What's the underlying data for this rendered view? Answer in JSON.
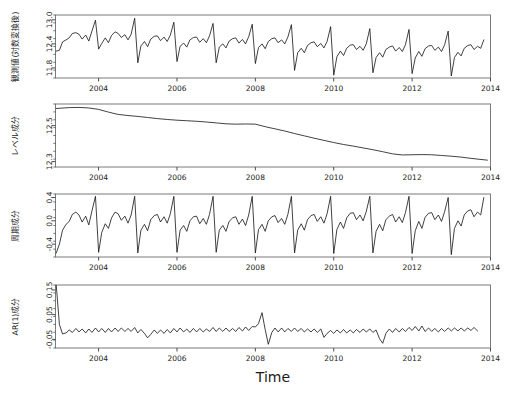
{
  "figure": {
    "x_axis_title": "Time",
    "x_tick_labels": [
      "2004",
      "2006",
      "2008",
      "2010",
      "2012",
      "2014"
    ],
    "x_tick_values": [
      2004,
      2006,
      2008,
      2010,
      2012,
      2014
    ],
    "x_range": [
      2002.9,
      2014.0
    ]
  },
  "chart_data": [
    {
      "type": "line",
      "title": "",
      "panel_index": 1,
      "ylabel": "観測値(対数変換後)",
      "xlabel": "",
      "ylim": [
        11.55,
        13.12
      ],
      "y_ticks": [
        11.8,
        12.4,
        13.0
      ],
      "y_tick_labels": [
        "11.8",
        "12.4",
        "13.0"
      ],
      "xlim": [
        2002.9,
        2014.0
      ],
      "grid": false,
      "legend": "none",
      "x": [
        2002.92,
        2003.0,
        2003.08,
        2003.17,
        2003.25,
        2003.33,
        2003.42,
        2003.5,
        2003.58,
        2003.67,
        2003.75,
        2003.83,
        2003.92,
        2004.0,
        2004.08,
        2004.17,
        2004.25,
        2004.33,
        2004.42,
        2004.5,
        2004.58,
        2004.67,
        2004.75,
        2004.83,
        2004.92,
        2005.0,
        2005.08,
        2005.17,
        2005.25,
        2005.33,
        2005.42,
        2005.5,
        2005.58,
        2005.67,
        2005.75,
        2005.83,
        2005.92,
        2006.0,
        2006.08,
        2006.17,
        2006.25,
        2006.33,
        2006.42,
        2006.5,
        2006.58,
        2006.67,
        2006.75,
        2006.83,
        2006.92,
        2007.0,
        2007.08,
        2007.17,
        2007.25,
        2007.33,
        2007.42,
        2007.5,
        2007.58,
        2007.67,
        2007.75,
        2007.83,
        2007.92,
        2008.0,
        2008.08,
        2008.17,
        2008.25,
        2008.33,
        2008.42,
        2008.5,
        2008.58,
        2008.67,
        2008.75,
        2008.83,
        2008.92,
        2009.0,
        2009.08,
        2009.17,
        2009.25,
        2009.33,
        2009.42,
        2009.5,
        2009.58,
        2009.67,
        2009.75,
        2009.83,
        2009.92,
        2010.0,
        2010.08,
        2010.17,
        2010.25,
        2010.33,
        2010.42,
        2010.5,
        2010.58,
        2010.67,
        2010.75,
        2010.83,
        2010.92,
        2011.0,
        2011.08,
        2011.17,
        2011.25,
        2011.33,
        2011.42,
        2011.5,
        2011.58,
        2011.67,
        2011.75,
        2011.83,
        2011.92,
        2012.0,
        2012.08,
        2012.17,
        2012.25,
        2012.33,
        2012.42,
        2012.5,
        2012.58,
        2012.67,
        2012.75,
        2012.83,
        2012.92,
        2013.0,
        2013.08,
        2013.17,
        2013.25,
        2013.33,
        2013.42,
        2013.5,
        2013.58,
        2013.67,
        2013.75,
        2013.83,
        2013.92
      ],
      "values": [
        12.22,
        12.24,
        12.45,
        12.5,
        12.55,
        12.66,
        12.68,
        12.64,
        12.52,
        12.62,
        12.47,
        12.72,
        12.99,
        12.27,
        12.41,
        12.55,
        12.43,
        12.61,
        12.7,
        12.66,
        12.56,
        12.63,
        12.5,
        12.64,
        13.04,
        11.93,
        12.35,
        12.46,
        12.33,
        12.52,
        12.59,
        12.6,
        12.48,
        12.57,
        12.46,
        12.62,
        12.94,
        11.96,
        12.34,
        12.42,
        12.32,
        12.5,
        12.56,
        12.57,
        12.44,
        12.53,
        12.43,
        12.6,
        12.91,
        11.93,
        12.32,
        12.4,
        12.3,
        12.47,
        12.53,
        12.55,
        12.42,
        12.51,
        12.4,
        12.58,
        12.89,
        11.91,
        12.31,
        12.4,
        12.28,
        12.46,
        12.53,
        12.55,
        12.43,
        12.5,
        12.4,
        12.57,
        12.88,
        11.74,
        12.18,
        12.29,
        12.18,
        12.36,
        12.43,
        12.45,
        12.33,
        12.41,
        12.3,
        12.46,
        12.83,
        11.62,
        12.08,
        12.22,
        12.11,
        12.29,
        12.37,
        12.38,
        12.26,
        12.34,
        12.24,
        12.4,
        12.78,
        11.68,
        12.06,
        12.18,
        12.07,
        12.26,
        12.32,
        12.35,
        12.22,
        12.31,
        12.21,
        12.38,
        12.76,
        11.66,
        12.05,
        12.21,
        12.09,
        12.28,
        12.35,
        12.36,
        12.24,
        12.32,
        12.21,
        12.38,
        12.72,
        11.6,
        12.06,
        12.19,
        12.1,
        12.29,
        12.36,
        12.38,
        12.26,
        12.34,
        12.29,
        12.5
      ]
    },
    {
      "type": "line",
      "title": "",
      "panel_index": 2,
      "ylabel": "レベル成分",
      "xlabel": "",
      "ylim": [
        12.27,
        12.62
      ],
      "y_ticks": [
        12.3,
        12.5
      ],
      "y_tick_labels": [
        "12.3",
        "12.5"
      ],
      "xlim": [
        2002.9,
        2014.0
      ],
      "grid": false,
      "legend": "none",
      "x": [
        2002.92,
        2003.25,
        2003.5,
        2003.75,
        2004.0,
        2004.25,
        2004.5,
        2004.75,
        2005.0,
        2005.25,
        2005.5,
        2005.75,
        2006.0,
        2006.25,
        2006.5,
        2006.75,
        2007.0,
        2007.25,
        2007.5,
        2007.75,
        2008.0,
        2008.25,
        2008.5,
        2008.75,
        2009.0,
        2009.25,
        2009.5,
        2009.75,
        2010.0,
        2010.25,
        2010.5,
        2010.75,
        2011.0,
        2011.25,
        2011.5,
        2011.75,
        2012.0,
        2012.25,
        2012.5,
        2012.75,
        2013.0,
        2013.25,
        2013.5,
        2013.92
      ],
      "values": [
        12.595,
        12.6,
        12.601,
        12.598,
        12.59,
        12.575,
        12.562,
        12.556,
        12.551,
        12.545,
        12.539,
        12.534,
        12.53,
        12.527,
        12.524,
        12.52,
        12.515,
        12.51,
        12.508,
        12.509,
        12.508,
        12.494,
        12.482,
        12.47,
        12.456,
        12.443,
        12.43,
        12.418,
        12.406,
        12.395,
        12.386,
        12.376,
        12.366,
        12.355,
        12.343,
        12.337,
        12.338,
        12.339,
        12.338,
        12.334,
        12.33,
        12.325,
        12.318,
        12.308
      ]
    },
    {
      "type": "line",
      "title": "",
      "panel_index": 3,
      "ylabel": "周期成分",
      "xlabel": "",
      "ylim": [
        -0.62,
        0.46
      ],
      "y_ticks": [
        -0.4,
        0.0,
        0.4
      ],
      "y_tick_labels": [
        "-0.4",
        "0.0",
        "0.4"
      ],
      "xlim": [
        2002.9,
        2014.0
      ],
      "grid": false,
      "legend": "none",
      "x": [
        2002.92,
        2003.0,
        2003.08,
        2003.17,
        2003.25,
        2003.33,
        2003.42,
        2003.5,
        2003.58,
        2003.67,
        2003.75,
        2003.83,
        2003.92,
        2004.0,
        2004.08,
        2004.17,
        2004.25,
        2004.33,
        2004.42,
        2004.5,
        2004.58,
        2004.67,
        2004.75,
        2004.83,
        2004.92,
        2005.0,
        2005.08,
        2005.17,
        2005.25,
        2005.33,
        2005.42,
        2005.5,
        2005.58,
        2005.67,
        2005.75,
        2005.83,
        2005.92,
        2006.0,
        2006.08,
        2006.17,
        2006.25,
        2006.33,
        2006.42,
        2006.5,
        2006.58,
        2006.67,
        2006.75,
        2006.83,
        2006.92,
        2007.0,
        2007.08,
        2007.17,
        2007.25,
        2007.33,
        2007.42,
        2007.5,
        2007.58,
        2007.67,
        2007.75,
        2007.83,
        2007.92,
        2008.0,
        2008.08,
        2008.17,
        2008.25,
        2008.33,
        2008.42,
        2008.5,
        2008.58,
        2008.67,
        2008.75,
        2008.83,
        2008.92,
        2009.0,
        2009.08,
        2009.17,
        2009.25,
        2009.33,
        2009.42,
        2009.5,
        2009.58,
        2009.67,
        2009.75,
        2009.83,
        2009.92,
        2010.0,
        2010.08,
        2010.17,
        2010.25,
        2010.33,
        2010.42,
        2010.5,
        2010.58,
        2010.67,
        2010.75,
        2010.83,
        2010.92,
        2011.0,
        2011.08,
        2011.17,
        2011.25,
        2011.33,
        2011.42,
        2011.5,
        2011.58,
        2011.67,
        2011.75,
        2011.83,
        2011.92,
        2012.0,
        2012.08,
        2012.17,
        2012.25,
        2012.33,
        2012.42,
        2012.5,
        2012.58,
        2012.67,
        2012.75,
        2012.83,
        2012.92,
        2013.0,
        2013.08,
        2013.17,
        2013.25,
        2013.33,
        2013.42,
        2013.5,
        2013.58,
        2013.67,
        2013.75,
        2013.83,
        2013.92
      ],
      "values": [
        -0.55,
        -0.4,
        -0.16,
        -0.06,
        -0.01,
        0.11,
        0.15,
        0.1,
        -0.02,
        0.08,
        -0.07,
        0.17,
        0.42,
        -0.54,
        -0.2,
        -0.05,
        -0.13,
        0.05,
        0.15,
        0.12,
        0.01,
        0.08,
        -0.04,
        0.1,
        0.42,
        -0.55,
        -0.16,
        -0.06,
        -0.17,
        0.02,
        0.09,
        0.11,
        -0.02,
        0.07,
        -0.04,
        0.12,
        0.42,
        -0.54,
        -0.16,
        -0.08,
        -0.18,
        0.0,
        0.07,
        0.08,
        -0.05,
        0.04,
        -0.06,
        0.11,
        0.42,
        -0.54,
        -0.16,
        -0.08,
        -0.18,
        -0.01,
        0.05,
        0.07,
        -0.06,
        0.03,
        -0.08,
        0.1,
        0.42,
        -0.55,
        -0.15,
        -0.06,
        -0.18,
        0.0,
        0.07,
        0.09,
        -0.03,
        0.04,
        -0.06,
        0.11,
        0.42,
        -0.55,
        -0.16,
        -0.05,
        -0.16,
        0.02,
        0.09,
        0.11,
        -0.01,
        0.07,
        -0.04,
        0.12,
        0.42,
        -0.56,
        -0.15,
        -0.02,
        -0.13,
        0.05,
        0.13,
        0.14,
        0.02,
        0.1,
        0.0,
        0.16,
        0.42,
        -0.55,
        -0.18,
        -0.06,
        -0.17,
        0.02,
        0.08,
        0.11,
        -0.02,
        0.07,
        -0.03,
        0.14,
        0.42,
        -0.56,
        -0.17,
        -0.01,
        -0.13,
        0.06,
        0.13,
        0.14,
        0.02,
        0.1,
        -0.01,
        0.16,
        0.4,
        -0.58,
        -0.13,
        0.0,
        -0.09,
        0.1,
        0.17,
        0.19,
        0.07,
        0.15,
        0.1,
        0.4
      ]
    },
    {
      "type": "line",
      "title": "",
      "panel_index": 4,
      "ylabel": "AR(1)成分",
      "xlabel": "Time",
      "ylim": [
        -0.085,
        0.17
      ],
      "y_ticks": [
        -0.05,
        0.05,
        0.15
      ],
      "y_tick_labels": [
        "-0.05",
        "0.05",
        "0.15"
      ],
      "xlim": [
        2002.9,
        2014.0
      ],
      "grid": false,
      "legend": "none",
      "x": [
        2002.92,
        2003.0,
        2003.08,
        2003.17,
        2003.25,
        2003.33,
        2003.42,
        2003.5,
        2003.58,
        2003.67,
        2003.75,
        2003.83,
        2003.92,
        2004.0,
        2004.08,
        2004.17,
        2004.25,
        2004.33,
        2004.42,
        2004.5,
        2004.58,
        2004.67,
        2004.75,
        2004.83,
        2004.92,
        2005.0,
        2005.08,
        2005.17,
        2005.25,
        2005.33,
        2005.42,
        2005.5,
        2005.58,
        2005.67,
        2005.75,
        2005.83,
        2005.92,
        2006.0,
        2006.08,
        2006.17,
        2006.25,
        2006.33,
        2006.42,
        2006.5,
        2006.58,
        2006.67,
        2006.75,
        2006.83,
        2006.92,
        2007.0,
        2007.08,
        2007.17,
        2007.25,
        2007.33,
        2007.42,
        2007.5,
        2007.58,
        2007.67,
        2007.75,
        2007.83,
        2007.92,
        2008.0,
        2008.08,
        2008.17,
        2008.25,
        2008.33,
        2008.42,
        2008.5,
        2008.58,
        2008.67,
        2008.75,
        2008.83,
        2008.92,
        2009.0,
        2009.08,
        2009.17,
        2009.25,
        2009.33,
        2009.42,
        2009.5,
        2009.58,
        2009.67,
        2009.75,
        2009.83,
        2009.92,
        2010.0,
        2010.08,
        2010.17,
        2010.25,
        2010.33,
        2010.42,
        2010.5,
        2010.58,
        2010.67,
        2010.75,
        2010.83,
        2010.92,
        2011.0,
        2011.08,
        2011.17,
        2011.25,
        2011.33,
        2011.42,
        2011.5,
        2011.58,
        2011.67,
        2011.75,
        2011.83,
        2011.92,
        2012.0,
        2012.08,
        2012.17,
        2012.25,
        2012.33,
        2012.42,
        2012.5,
        2012.58,
        2012.67,
        2012.75,
        2012.83,
        2012.92,
        2013.0,
        2013.08,
        2013.17,
        2013.25,
        2013.33,
        2013.42,
        2013.5,
        2013.58,
        2013.67,
        2013.75,
        2013.83,
        2013.92
      ],
      "values": [
        0.168,
        0.01,
        -0.028,
        -0.024,
        -0.012,
        -0.022,
        -0.006,
        -0.02,
        -0.008,
        -0.024,
        -0.008,
        -0.022,
        -0.004,
        -0.02,
        -0.006,
        -0.022,
        -0.006,
        -0.02,
        -0.004,
        -0.018,
        -0.004,
        -0.018,
        -0.006,
        -0.018,
        -0.002,
        -0.024,
        -0.01,
        -0.026,
        -0.044,
        -0.03,
        -0.012,
        -0.026,
        -0.012,
        -0.026,
        -0.01,
        -0.024,
        -0.006,
        -0.02,
        -0.004,
        -0.02,
        -0.008,
        -0.022,
        -0.006,
        -0.02,
        -0.006,
        -0.02,
        -0.008,
        -0.018,
        -0.002,
        -0.018,
        -0.004,
        -0.018,
        -0.004,
        -0.018,
        -0.006,
        -0.018,
        -0.002,
        -0.016,
        0.0,
        -0.014,
        0.002,
        0.0,
        0.014,
        0.058,
        -0.01,
        -0.07,
        -0.022,
        -0.004,
        -0.02,
        -0.004,
        -0.02,
        -0.006,
        -0.018,
        -0.004,
        -0.018,
        -0.006,
        -0.02,
        -0.008,
        -0.02,
        -0.008,
        -0.022,
        -0.008,
        -0.042,
        -0.026,
        -0.014,
        -0.026,
        -0.012,
        -0.024,
        -0.01,
        -0.024,
        -0.012,
        -0.024,
        -0.01,
        -0.022,
        -0.008,
        -0.02,
        -0.008,
        -0.022,
        -0.012,
        -0.048,
        -0.066,
        -0.026,
        -0.008,
        -0.022,
        -0.006,
        -0.02,
        -0.006,
        -0.018,
        -0.002,
        -0.014,
        0.002,
        -0.016,
        0.004,
        -0.018,
        -0.004,
        -0.018,
        -0.006,
        -0.02,
        -0.006,
        -0.018,
        -0.004,
        -0.016,
        -0.004,
        -0.016,
        -0.004,
        -0.016,
        -0.004,
        -0.014,
        -0.002,
        -0.016
      ]
    }
  ]
}
